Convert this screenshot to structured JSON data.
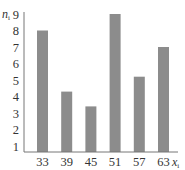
{
  "chart_data": {
    "type": "bar",
    "title": "",
    "xlabel": "x_i",
    "ylabel": "n_i",
    "categories": [
      "33",
      "39",
      "45",
      "51",
      "57",
      "63"
    ],
    "values": [
      8,
      4.3,
      3.4,
      9,
      5.2,
      7
    ],
    "ylim": [
      0.6,
      9
    ],
    "yticks": [
      1,
      2,
      3,
      4,
      5,
      6,
      7,
      8,
      9
    ],
    "grid": false,
    "legend": null,
    "bar_color": "#8c8c8c"
  },
  "axes": {
    "x_label_main": "x",
    "x_label_sub": "i",
    "y_label_main": "n",
    "y_label_sub": "i"
  }
}
